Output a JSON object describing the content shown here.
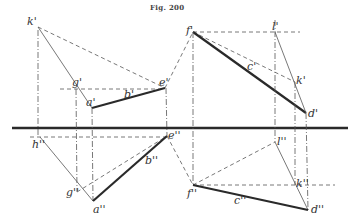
{
  "figure": {
    "title": "Fig. 200",
    "ground_line": {
      "x1": 12,
      "y1": 128,
      "x2": 348,
      "y2": 128
    },
    "points": {
      "k1": {
        "label": "k'",
        "x": 38,
        "y": 27
      },
      "g1": {
        "label": "g'",
        "x": 75,
        "y": 89
      },
      "e1": {
        "label": "e'",
        "x": 165,
        "y": 88
      },
      "a1": {
        "label": "a'",
        "x": 92,
        "y": 108
      },
      "f1": {
        "label": "f'",
        "x": 193,
        "y": 32
      },
      "l1": {
        "label": "l'",
        "x": 275,
        "y": 32
      },
      "kr1": {
        "label": "k'",
        "x": 295,
        "y": 82
      },
      "d1": {
        "label": "d'",
        "x": 306,
        "y": 113
      },
      "h2": {
        "label": "h''",
        "x": 40,
        "y": 137
      },
      "g2": {
        "label": "g''",
        "x": 77,
        "y": 192
      },
      "a2": {
        "label": "a''",
        "x": 93,
        "y": 201
      },
      "e2": {
        "label": "e''",
        "x": 167,
        "y": 136
      },
      "f2": {
        "label": "f''",
        "x": 193,
        "y": 185
      },
      "l2": {
        "label": "l''",
        "x": 275,
        "y": 142
      },
      "kr2": {
        "label": "k''",
        "x": 295,
        "y": 185
      },
      "d2": {
        "label": "d''",
        "x": 308,
        "y": 210
      }
    },
    "edge_labels": {
      "b1": "b'",
      "b2": "b''",
      "c1": "c'",
      "c2": "c''"
    }
  }
}
